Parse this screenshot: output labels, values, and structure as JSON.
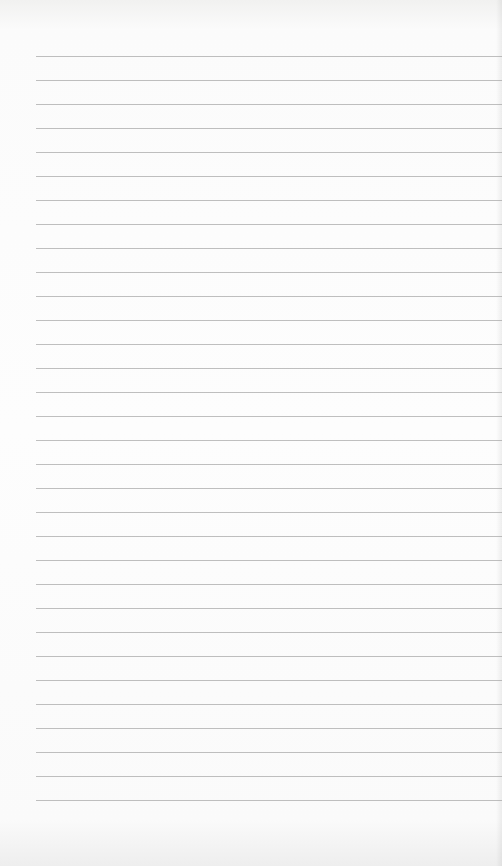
{
  "paper": {
    "type": "lined-paper",
    "line_count": 32,
    "first_line_y": 56,
    "line_spacing": 24,
    "line_left": 36,
    "line_color": "#a9a9a9",
    "background_color": "#fdfdfd"
  }
}
